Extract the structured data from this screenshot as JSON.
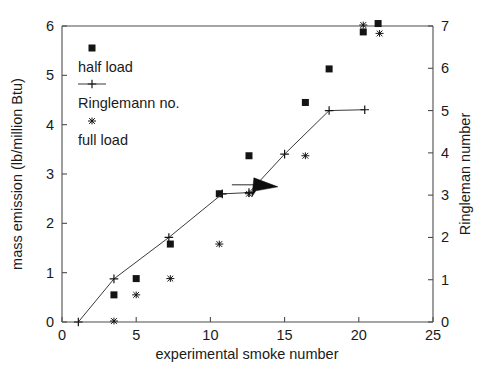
{
  "chart_data": {
    "type": "scatter",
    "title": "",
    "xlabel": "experimental smoke number",
    "ylabel": "mass emission (lb/million Btu)",
    "y2label": "Ringleman number",
    "xlim": [
      0,
      25
    ],
    "ylim": [
      0,
      6
    ],
    "y2lim": [
      0,
      7
    ],
    "xticks": [
      0,
      5,
      10,
      15,
      20,
      25
    ],
    "xticklabels": [
      "0",
      "5",
      "10",
      "15",
      "20",
      "25"
    ],
    "yticks": [
      0,
      1,
      2,
      3,
      4,
      5,
      6
    ],
    "yticklabels": [
      "0",
      "1",
      "2",
      "3",
      "4",
      "5",
      "6"
    ],
    "y2ticks": [
      0,
      1,
      2,
      3,
      4,
      5,
      6,
      7
    ],
    "y2ticklabels": [
      "0",
      "1",
      "2",
      "3",
      "4",
      "5",
      "6",
      "7"
    ],
    "grid": false,
    "legend_position": "upper-left-inside",
    "series": [
      {
        "name": "half load",
        "marker": "square",
        "axis": "left",
        "points": [
          [
            3.5,
            0.55
          ],
          [
            5.0,
            0.88
          ],
          [
            7.3,
            1.58
          ],
          [
            10.6,
            2.6
          ],
          [
            12.6,
            3.37
          ],
          [
            16.4,
            4.45
          ],
          [
            18.0,
            5.13
          ],
          [
            20.3,
            5.88
          ],
          [
            21.3,
            6.05
          ]
        ]
      },
      {
        "name": "Ringlemann no.",
        "marker": "plus-line",
        "axis": "right",
        "points": [
          [
            1.1,
            0.0
          ],
          [
            3.5,
            1.02
          ],
          [
            7.2,
            2.0
          ],
          [
            10.8,
            3.03
          ],
          [
            12.6,
            3.06
          ],
          [
            15.0,
            3.97
          ],
          [
            18.0,
            5.0
          ],
          [
            20.4,
            5.02
          ]
        ]
      },
      {
        "name": "full load",
        "marker": "star",
        "axis": "left",
        "points": [
          [
            3.5,
            0.02
          ],
          [
            5.0,
            0.55
          ],
          [
            7.3,
            0.88
          ],
          [
            10.6,
            1.58
          ],
          [
            12.6,
            2.6
          ],
          [
            16.4,
            3.37
          ],
          [
            20.3,
            6.02
          ],
          [
            21.4,
            5.85
          ]
        ]
      }
    ],
    "annotations": [
      {
        "name": "mouse-cursor",
        "kind": "arrow-pointer",
        "x": 13.2,
        "y": 2.72
      }
    ]
  },
  "legend": {
    "entries": [
      {
        "label": "half load",
        "marker": "square"
      },
      {
        "label": "Ringlemann no.",
        "marker": "plus-line"
      },
      {
        "label": "full load",
        "marker": "star"
      }
    ]
  }
}
